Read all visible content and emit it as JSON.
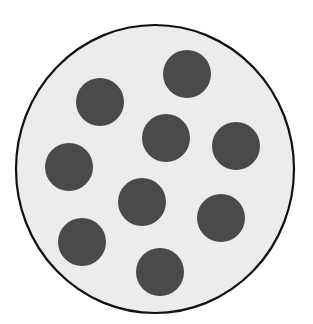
{
  "diagram": {
    "type": "dots-in-circle",
    "dot_count": 9,
    "colors": {
      "background": "#ffffff",
      "circle_fill": "#ececec",
      "circle_stroke": "#111111",
      "dot_fill": "#4a4a4a"
    },
    "container": {
      "cx": 155,
      "cy": 169,
      "rx": 139,
      "ry": 144,
      "stroke_width": 2.2
    },
    "dots": [
      {
        "cx": 187,
        "cy": 74,
        "r": 24
      },
      {
        "cx": 100,
        "cy": 102,
        "r": 24
      },
      {
        "cx": 166,
        "cy": 138,
        "r": 24
      },
      {
        "cx": 236,
        "cy": 146,
        "r": 24
      },
      {
        "cx": 69,
        "cy": 167,
        "r": 24
      },
      {
        "cx": 142,
        "cy": 202,
        "r": 24
      },
      {
        "cx": 221,
        "cy": 218,
        "r": 24
      },
      {
        "cx": 82,
        "cy": 242,
        "r": 24
      },
      {
        "cx": 160,
        "cy": 272,
        "r": 24
      }
    ]
  }
}
